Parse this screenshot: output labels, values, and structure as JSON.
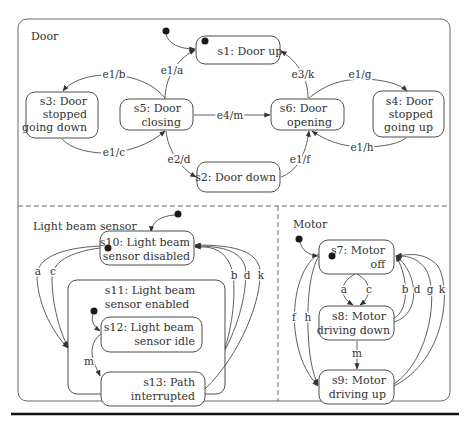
{
  "regions": {
    "door": {
      "label": "Door"
    },
    "light": {
      "label": "Light beam sensor"
    },
    "motor": {
      "label": "Motor"
    }
  },
  "states": {
    "s1": {
      "lines": [
        "s1: Door up"
      ],
      "initial": true
    },
    "s2": {
      "lines": [
        "s2: Door down"
      ]
    },
    "s3": {
      "lines": [
        "s3: Door",
        "stopped",
        "going down"
      ]
    },
    "s4": {
      "lines": [
        "s4: Door",
        "stopped",
        "going up"
      ]
    },
    "s5": {
      "lines": [
        "s5: Door",
        "closing"
      ]
    },
    "s6": {
      "lines": [
        "s6: Door",
        "opening"
      ]
    },
    "s7": {
      "lines": [
        "s7: Motor",
        "off"
      ],
      "initial": true
    },
    "s8": {
      "lines": [
        "s8: Motor",
        "driving down"
      ]
    },
    "s9": {
      "lines": [
        "s9: Motor",
        "driving up"
      ]
    },
    "s10": {
      "lines": [
        "s10: Light beam",
        "sensor disabled"
      ],
      "initial": true
    },
    "s11": {
      "lines": [
        "s11: Light beam",
        "sensor enabled"
      ]
    },
    "s12": {
      "lines": [
        "s12: Light beam",
        "sensor idle"
      ]
    },
    "s13": {
      "lines": [
        "s13: Path",
        "interrupted"
      ]
    }
  },
  "transitions": {
    "door": [
      {
        "from": "s5",
        "to": "s1",
        "label": "e1/a"
      },
      {
        "from": "s5",
        "to": "s3",
        "label": "e1/b"
      },
      {
        "from": "s3",
        "to": "s5",
        "label": "e1/c"
      },
      {
        "from": "s5",
        "to": "s2",
        "label": "e2/d"
      },
      {
        "from": "s5",
        "to": "s6",
        "label": "e4/m"
      },
      {
        "from": "s2",
        "to": "s6",
        "label": "e1/f"
      },
      {
        "from": "s6",
        "to": "s1",
        "label": "e3/k"
      },
      {
        "from": "s6",
        "to": "s4",
        "label": "e1/g"
      },
      {
        "from": "s4",
        "to": "s6",
        "label": "e1/h"
      }
    ],
    "light": [
      {
        "from": "s10",
        "to": "s11",
        "label": "a"
      },
      {
        "from": "s10",
        "to": "s11",
        "label": "c"
      },
      {
        "from": "s11",
        "to": "s10",
        "label": "b"
      },
      {
        "from": "s11",
        "to": "s10",
        "label": "d"
      },
      {
        "from": "s13",
        "to": "s10",
        "label": "k"
      },
      {
        "from": "s12",
        "to": "s13",
        "label": "m"
      }
    ],
    "motor": [
      {
        "from": "s7",
        "to": "s8",
        "label": "a"
      },
      {
        "from": "s7",
        "to": "s8",
        "label": "c"
      },
      {
        "from": "s8",
        "to": "s7",
        "label": "b"
      },
      {
        "from": "s8",
        "to": "s7",
        "label": "d"
      },
      {
        "from": "s9",
        "to": "s7",
        "label": "g"
      },
      {
        "from": "s9",
        "to": "s7",
        "label": "k"
      },
      {
        "from": "s8",
        "to": "s9",
        "label": "m"
      },
      {
        "from": "s7",
        "to": "s9",
        "label": "f"
      },
      {
        "from": "s7",
        "to": "s9",
        "label": "h"
      }
    ]
  }
}
